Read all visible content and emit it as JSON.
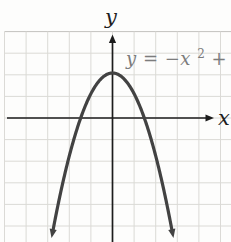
{
  "figure": {
    "axis_labels": {
      "x": "x",
      "y": "y"
    },
    "equation": {
      "base": "y = −x",
      "exponent": "2",
      "rest": " + 2",
      "full": "y = -x^2 + 2"
    },
    "colors": {
      "background": "#fdfdfc",
      "grid": "#dbdad6",
      "grid_top_border": "#c3c2be",
      "axis": "#1c1c1c",
      "curve": "#424242",
      "equation_text": "#7c7c7c",
      "axis_label_text": "#1f1f1f"
    }
  },
  "chart_data": {
    "type": "line",
    "function": "y = -x^2 + 2",
    "coefficients": {
      "a": -1,
      "b": 0,
      "c": 2
    },
    "x_range": [
      -2.66,
      2.66
    ],
    "y_range_visible": [
      -5.1,
      2
    ],
    "key_points": {
      "vertex": [
        0,
        2
      ],
      "y_intercept": [
        0,
        2
      ],
      "x_intercepts": [
        [
          -1.414,
          0
        ],
        [
          1.414,
          0
        ]
      ]
    },
    "xlabel": "x",
    "ylabel": "y",
    "grid": true,
    "legend": false,
    "axes_arrows": {
      "x_axis": "right",
      "y_axis": "up",
      "curve_ends": "both-down"
    }
  }
}
